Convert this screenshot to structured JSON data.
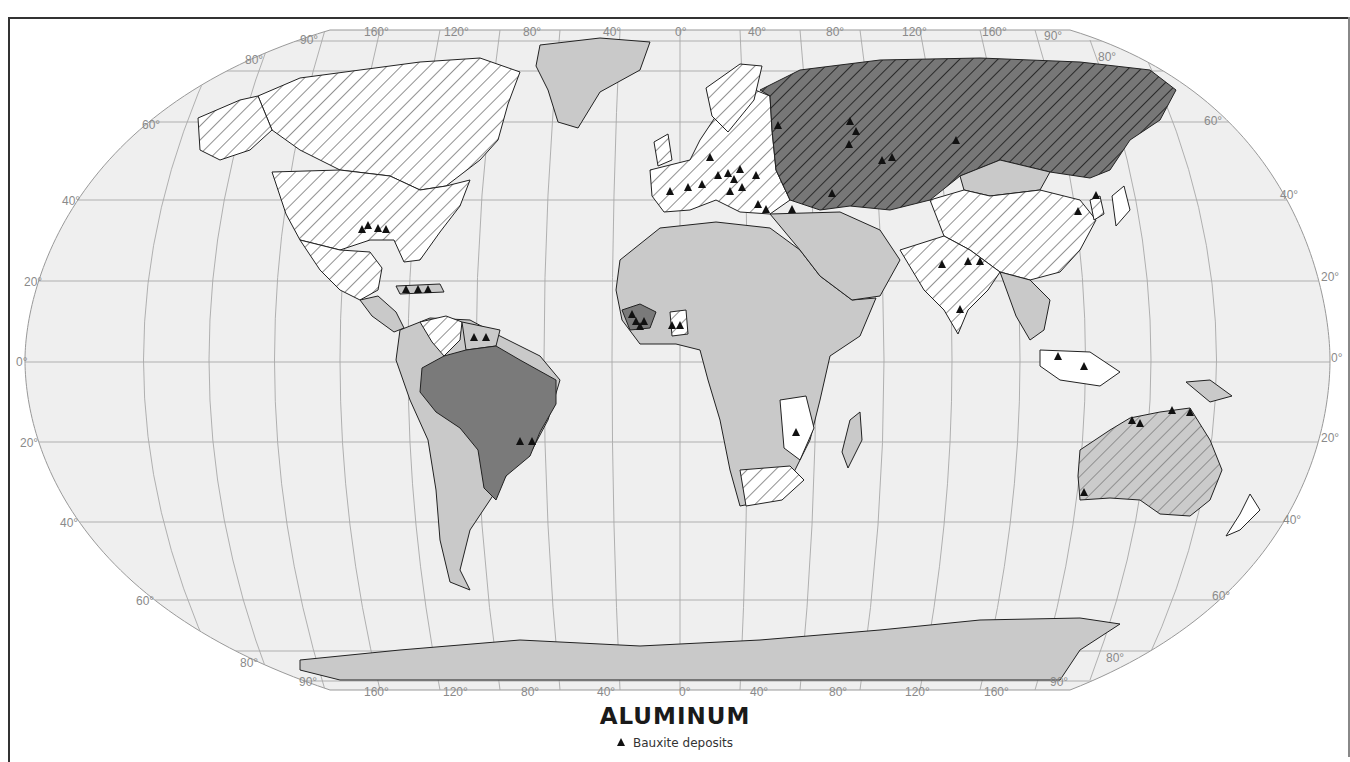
{
  "map": {
    "title": "ALUMINUM",
    "legend": [
      {
        "symbol": "triangle",
        "label": "Bauxite deposits",
        "color": "#111111"
      }
    ],
    "projection": "Robinson",
    "graticule": {
      "longitude_labels_top": [
        "90°",
        "160°",
        "120°",
        "80°",
        "40°",
        "0°",
        "40°",
        "80°",
        "120°",
        "160°",
        "90°"
      ],
      "longitude_labels_bottom": [
        "90°",
        "160°",
        "120°",
        "80°",
        "40°",
        "0°",
        "40°",
        "80°",
        "120°",
        "160°",
        "90°"
      ],
      "latitude_labels_left": [
        "80°",
        "60°",
        "40°",
        "20°",
        "0°",
        "20°",
        "40°",
        "60°",
        "80°"
      ],
      "latitude_labels_right": [
        "80°",
        "60°",
        "40°",
        "20°",
        "0°",
        "20°",
        "40°",
        "60°",
        "80°"
      ]
    },
    "fill_categories": [
      {
        "name": "dark-hatched",
        "color": "#6e6e6e",
        "examples": [
          "USSR"
        ]
      },
      {
        "name": "dark-solid",
        "color": "#7a7a7a",
        "examples": [
          "Brazil",
          "Guinea"
        ]
      },
      {
        "name": "light-gray-hatched",
        "color": "#c8c8c8",
        "examples": [
          "Australia"
        ]
      },
      {
        "name": "white-hatched",
        "color": "#ffffff",
        "examples": [
          "USA",
          "Canada",
          "Europe",
          "China",
          "India",
          "Venezuela",
          "South Africa"
        ]
      },
      {
        "name": "light-gray",
        "color": "#c9c9c9",
        "examples": [
          "Africa",
          "South America",
          "Middle East",
          "Antarctica",
          "Mongolia"
        ]
      },
      {
        "name": "white",
        "color": "#ffffff",
        "examples": [
          "Greenland ice",
          "Southeast Asia"
        ]
      }
    ],
    "colors": {
      "ocean": "#efefef",
      "graticule": "#a0a0a0",
      "border": "#222222",
      "marker": "#111111"
    },
    "deposits": [
      {
        "x": 368,
        "y": 226
      },
      {
        "x": 378,
        "y": 229
      },
      {
        "x": 386,
        "y": 230
      },
      {
        "x": 362,
        "y": 230
      },
      {
        "x": 406,
        "y": 290
      },
      {
        "x": 418,
        "y": 290
      },
      {
        "x": 428,
        "y": 290
      },
      {
        "x": 474,
        "y": 338
      },
      {
        "x": 486,
        "y": 338
      },
      {
        "x": 520,
        "y": 442
      },
      {
        "x": 532,
        "y": 442
      },
      {
        "x": 632,
        "y": 315
      },
      {
        "x": 636,
        "y": 322
      },
      {
        "x": 640,
        "y": 327
      },
      {
        "x": 644,
        "y": 322
      },
      {
        "x": 672,
        "y": 326
      },
      {
        "x": 680,
        "y": 326
      },
      {
        "x": 670,
        "y": 192
      },
      {
        "x": 688,
        "y": 188
      },
      {
        "x": 702,
        "y": 185
      },
      {
        "x": 718,
        "y": 176
      },
      {
        "x": 728,
        "y": 174
      },
      {
        "x": 734,
        "y": 180
      },
      {
        "x": 742,
        "y": 188
      },
      {
        "x": 730,
        "y": 192
      },
      {
        "x": 740,
        "y": 170
      },
      {
        "x": 756,
        "y": 176
      },
      {
        "x": 758,
        "y": 205
      },
      {
        "x": 766,
        "y": 210
      },
      {
        "x": 792,
        "y": 210
      },
      {
        "x": 710,
        "y": 158
      },
      {
        "x": 778,
        "y": 126
      },
      {
        "x": 850,
        "y": 122
      },
      {
        "x": 856,
        "y": 132
      },
      {
        "x": 849,
        "y": 145
      },
      {
        "x": 882,
        "y": 161
      },
      {
        "x": 892,
        "y": 158
      },
      {
        "x": 956,
        "y": 141
      },
      {
        "x": 832,
        "y": 194
      },
      {
        "x": 942,
        "y": 265
      },
      {
        "x": 968,
        "y": 262
      },
      {
        "x": 980,
        "y": 262
      },
      {
        "x": 960,
        "y": 310
      },
      {
        "x": 1084,
        "y": 367
      },
      {
        "x": 1058,
        "y": 357
      },
      {
        "x": 1096,
        "y": 196
      },
      {
        "x": 1078,
        "y": 212
      },
      {
        "x": 1132,
        "y": 421
      },
      {
        "x": 1140,
        "y": 424
      },
      {
        "x": 1172,
        "y": 411
      },
      {
        "x": 1190,
        "y": 413
      },
      {
        "x": 1084,
        "y": 493
      },
      {
        "x": 796,
        "y": 433
      }
    ]
  }
}
